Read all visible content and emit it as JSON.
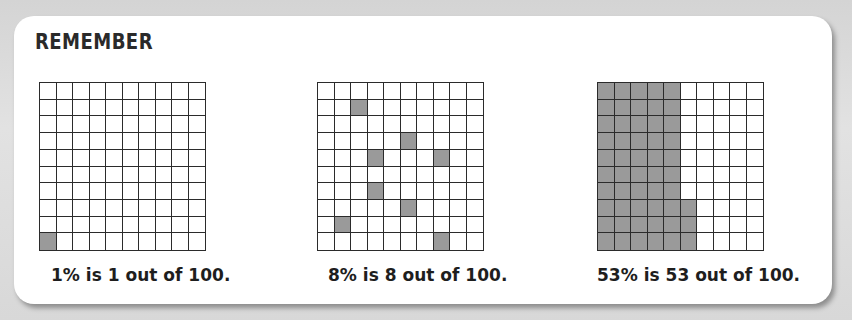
{
  "title": "REMEMBER",
  "colors": {
    "filled_cell": "#9a9a9a",
    "empty_cell": "#ffffff",
    "grid_line": "#2b2b2b",
    "card_background": "#ffffff",
    "frame_background": "#d9d9d9"
  },
  "panels": [
    {
      "percent": 1,
      "caption": "1% is 1 out of 100.",
      "rows": 10,
      "cols": 10,
      "filled_cells": [
        [
          9,
          0
        ]
      ]
    },
    {
      "percent": 8,
      "caption": "8% is 8 out of 100.",
      "rows": 10,
      "cols": 10,
      "filled_cells": [
        [
          1,
          2
        ],
        [
          3,
          5
        ],
        [
          4,
          3
        ],
        [
          4,
          7
        ],
        [
          6,
          3
        ],
        [
          7,
          5
        ],
        [
          8,
          1
        ],
        [
          9,
          7
        ]
      ]
    },
    {
      "percent": 53,
      "caption": "53% is 53 out of 100.",
      "rows": 10,
      "cols": 10,
      "filled_cells": "columns 0-4 fully filled (50 cells) plus column 5 rows 7-9 (3 cells)"
    }
  ],
  "chart_data": {
    "type": "heatmap",
    "title": "REMEMBER",
    "grids": [
      {
        "label": "1% is 1 out of 100.",
        "filled": 1,
        "total": 100,
        "filled_cells_row_col": [
          [
            9,
            0
          ]
        ]
      },
      {
        "label": "8% is 8 out of 100.",
        "filled": 8,
        "total": 100,
        "filled_cells_row_col": [
          [
            1,
            2
          ],
          [
            3,
            5
          ],
          [
            4,
            3
          ],
          [
            4,
            7
          ],
          [
            6,
            3
          ],
          [
            7,
            5
          ],
          [
            8,
            1
          ],
          [
            9,
            7
          ]
        ]
      },
      {
        "label": "53% is 53 out of 100.",
        "filled": 53,
        "total": 100,
        "filled_cells_row_col": [
          [
            0,
            0
          ],
          [
            0,
            1
          ],
          [
            0,
            2
          ],
          [
            0,
            3
          ],
          [
            0,
            4
          ],
          [
            1,
            0
          ],
          [
            1,
            1
          ],
          [
            1,
            2
          ],
          [
            1,
            3
          ],
          [
            1,
            4
          ],
          [
            2,
            0
          ],
          [
            2,
            1
          ],
          [
            2,
            2
          ],
          [
            2,
            3
          ],
          [
            2,
            4
          ],
          [
            3,
            0
          ],
          [
            3,
            1
          ],
          [
            3,
            2
          ],
          [
            3,
            3
          ],
          [
            3,
            4
          ],
          [
            4,
            0
          ],
          [
            4,
            1
          ],
          [
            4,
            2
          ],
          [
            4,
            3
          ],
          [
            4,
            4
          ],
          [
            5,
            0
          ],
          [
            5,
            1
          ],
          [
            5,
            2
          ],
          [
            5,
            3
          ],
          [
            5,
            4
          ],
          [
            6,
            0
          ],
          [
            6,
            1
          ],
          [
            6,
            2
          ],
          [
            6,
            3
          ],
          [
            6,
            4
          ],
          [
            7,
            0
          ],
          [
            7,
            1
          ],
          [
            7,
            2
          ],
          [
            7,
            3
          ],
          [
            7,
            4
          ],
          [
            7,
            5
          ],
          [
            8,
            0
          ],
          [
            8,
            1
          ],
          [
            8,
            2
          ],
          [
            8,
            3
          ],
          [
            8,
            4
          ],
          [
            8,
            5
          ],
          [
            9,
            0
          ],
          [
            9,
            1
          ],
          [
            9,
            2
          ],
          [
            9,
            3
          ],
          [
            9,
            4
          ],
          [
            9,
            5
          ]
        ]
      }
    ],
    "grid_on": true,
    "legend": null
  }
}
